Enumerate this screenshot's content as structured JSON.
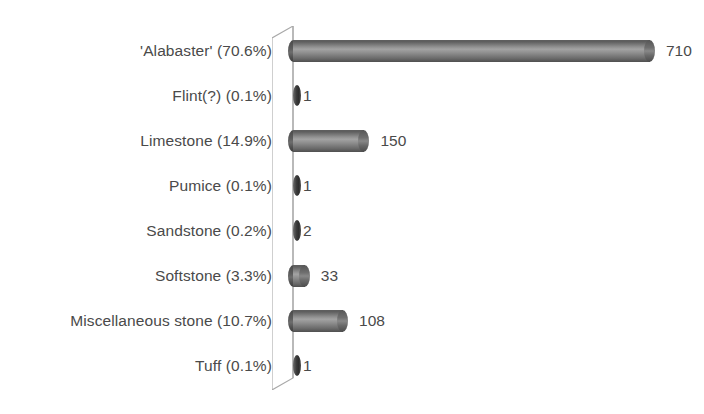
{
  "chart_data": {
    "type": "bar",
    "orientation": "horizontal",
    "title": "",
    "xlabel": "",
    "ylabel": "",
    "grid": false,
    "legend": false,
    "xlim": [
      0,
      710
    ],
    "categories": [
      "'Alabaster' (70.6%)",
      "Flint(?) (0.1%)",
      "Limestone (14.9%)",
      "Pumice (0.1%)",
      "Sandstone (0.2%)",
      "Softstone (3.3%)",
      "Miscellaneous stone (10.7%)",
      "Tuff (0.1%)"
    ],
    "values": [
      710,
      1,
      150,
      1,
      2,
      33,
      108,
      1
    ],
    "value_labels": [
      "710",
      "1",
      "150",
      "1",
      "2",
      "33",
      "108",
      "1"
    ],
    "percentages": [
      "70.6%",
      "0.1%",
      "14.9%",
      "0.1%",
      "0.2%",
      "3.3%",
      "10.7%",
      "0.1%"
    ],
    "names": [
      "'Alabaster'",
      "Flint(?)",
      "Limestone",
      "Pumice",
      "Sandstone",
      "Softstone",
      "Miscellaneous stone",
      "Tuff"
    ]
  },
  "style": {
    "bar_color": "#7d7d7d",
    "bar_color_dark": "#4f4f4f",
    "bar_color_light": "#a3a3a3",
    "text_color": "#4a4a4a",
    "axis_color": "#9a9a9a",
    "background": "#ffffff"
  }
}
